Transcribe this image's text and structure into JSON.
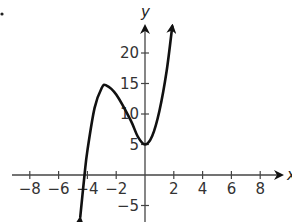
{
  "chart_data": {
    "type": "line",
    "title": "",
    "xlabel": "x",
    "ylabel": "y",
    "xlim": [
      -9,
      9.5
    ],
    "ylim": [
      -7,
      25
    ],
    "x_ticks": [
      -8,
      -6,
      -4,
      -2,
      2,
      4,
      6,
      8
    ],
    "x_tick_labels": [
      "−8",
      "−6",
      "−4",
      "−2",
      "2",
      "4",
      "6",
      "8"
    ],
    "y_ticks": [
      20,
      15,
      10,
      5,
      -5
    ],
    "y_tick_labels": [
      "20",
      "15",
      "10",
      "5",
      "−5"
    ],
    "grid": false,
    "legend": null,
    "series": [
      {
        "name": "cubic",
        "description": "Cubic polynomial with local max near (-2.7, 14.7), local min at (0, 5), x-intercept near -4.2; arrows on both ends",
        "points": [
          [
            -4.5,
            -7
          ],
          [
            -4.2,
            0
          ],
          [
            -4.0,
            4
          ],
          [
            -3.5,
            11
          ],
          [
            -3.0,
            14.3
          ],
          [
            -2.7,
            14.7
          ],
          [
            -2.0,
            13.2
          ],
          [
            -1.0,
            9
          ],
          [
            -0.5,
            6.3
          ],
          [
            0,
            5
          ],
          [
            0.5,
            6.4
          ],
          [
            1.0,
            10.5
          ],
          [
            1.5,
            17
          ],
          [
            1.9,
            24.5
          ]
        ]
      }
    ]
  },
  "marker": "."
}
